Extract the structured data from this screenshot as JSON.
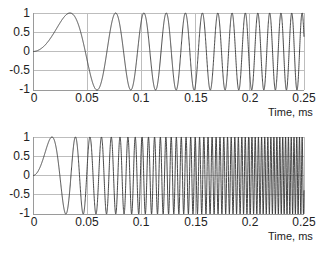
{
  "chart_data": [
    {
      "type": "line",
      "title": "",
      "xlabel": "Time, ms",
      "ylabel": "",
      "xlim": [
        0,
        0.25
      ],
      "ylim": [
        -1,
        1
      ],
      "grid": true,
      "legend": null,
      "description": "Linear chirp y = sin(pi*k*t^2), slower sweep",
      "chirp_rate_k": 430,
      "xticks": [
        "0",
        "0.05",
        "0.1",
        "0.15",
        "0.2",
        "0.25"
      ],
      "yticks": [
        "1",
        "0.5",
        "0",
        "-0.5",
        "-1"
      ],
      "series": [
        {
          "name": "chirp 1",
          "color": "#333333"
        }
      ]
    },
    {
      "type": "line",
      "title": "",
      "xlabel": "Time, ms",
      "ylabel": "",
      "xlim": [
        0,
        0.25
      ],
      "ylim": [
        -1,
        1
      ],
      "grid": true,
      "legend": null,
      "description": "Linear chirp y = sin(pi*k*t^2), faster sweep",
      "chirp_rate_k": 1630,
      "xticks": [
        "0",
        "0.05",
        "0.1",
        "0.15",
        "0.2",
        "0.25"
      ],
      "yticks": [
        "1",
        "0.5",
        "0",
        "-0.5",
        "-1"
      ],
      "series": [
        {
          "name": "chirp 2",
          "color": "#333333"
        }
      ]
    }
  ],
  "top": {
    "xlabel": "Time, ms",
    "xticks": [
      "0",
      "0.05",
      "0.1",
      "0.15",
      "0.2",
      "0.25"
    ],
    "yticks": [
      "1",
      "0.5",
      "0",
      "-0.5",
      "-1"
    ]
  },
  "bottom": {
    "xlabel": "Time, ms",
    "xticks": [
      "0",
      "0.05",
      "0.1",
      "0.15",
      "0.2",
      "0.25"
    ],
    "yticks": [
      "1",
      "0.5",
      "0",
      "-0.5",
      "-1"
    ]
  }
}
